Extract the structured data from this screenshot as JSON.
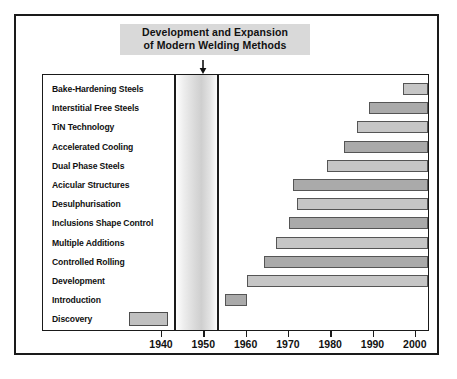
{
  "figure": {
    "title_lines": [
      "Development and Expansion",
      "of Modern Welding Methods"
    ],
    "arrow_icon": "down-arrow-icon",
    "annotation_year": 1950,
    "band_label": "modern-welding-methods-band"
  },
  "colors": {
    "frame": "#1a1a1a",
    "bar_light": "#c6c6c6",
    "bar_dark": "#aaaaaa",
    "bar_border": "#555555",
    "title_highlight": "#d9d9d9",
    "band_shade": "#cfcfcf",
    "text": "#111111",
    "background": "#ffffff"
  },
  "chart_data": {
    "type": "bar",
    "orientation": "horizontal",
    "title": "Development and Expansion of Modern Welding Methods",
    "xlabel": "",
    "ylabel": "",
    "xlim": [
      1936,
      2003
    ],
    "xticks": [
      1940,
      1950,
      1960,
      1970,
      1980,
      1990,
      2000
    ],
    "xtick_labels": [
      "1940",
      "1950",
      "1960",
      "1970",
      "1980",
      "1990",
      "2000"
    ],
    "grid": false,
    "legend": false,
    "axis_start_year": 1953,
    "axis_end_year": 2003,
    "note": "Horizontal timeline bars: each technology begins at its start year and continues to the present (right edge of plot).",
    "categories": [
      "Bake-Hardening Steels",
      "Interstitial Free Steels",
      "TiN Technology",
      "Accelerated Cooling",
      "Dual Phase Steels",
      "Acicular Structures",
      "Desulphurisation",
      "Inclusions Shape Control",
      "Multiple Additions",
      "Controlled Rolling",
      "Development",
      "Introduction",
      "Discovery"
    ],
    "bars": [
      {
        "label": "Bake-Hardening Steels",
        "start": 1997,
        "end": 2003,
        "shade": "light"
      },
      {
        "label": "Interstitial Free Steels",
        "start": 1989,
        "end": 2003,
        "shade": "dark"
      },
      {
        "label": "TiN Technology",
        "start": 1986,
        "end": 2003,
        "shade": "light"
      },
      {
        "label": "Accelerated Cooling",
        "start": 1983,
        "end": 2003,
        "shade": "dark"
      },
      {
        "label": "Dual Phase Steels",
        "start": 1979,
        "end": 2003,
        "shade": "light"
      },
      {
        "label": "Acicular Structures",
        "start": 1971,
        "end": 2003,
        "shade": "dark"
      },
      {
        "label": "Desulphurisation",
        "start": 1972,
        "end": 2003,
        "shade": "light"
      },
      {
        "label": "Inclusions Shape Control",
        "start": 1970,
        "end": 2003,
        "shade": "dark"
      },
      {
        "label": "Multiple Additions",
        "start": 1967,
        "end": 2003,
        "shade": "light"
      },
      {
        "label": "Controlled Rolling",
        "start": 1964,
        "end": 2003,
        "shade": "dark"
      },
      {
        "label": "Development",
        "start": 1960,
        "end": 2003,
        "shade": "light"
      },
      {
        "label": "Introduction",
        "start": 1955,
        "end": 1960,
        "shade": "dark"
      },
      {
        "label": "Discovery",
        "start": null,
        "end": null,
        "shade": "light",
        "legend_swatch": true
      }
    ]
  }
}
